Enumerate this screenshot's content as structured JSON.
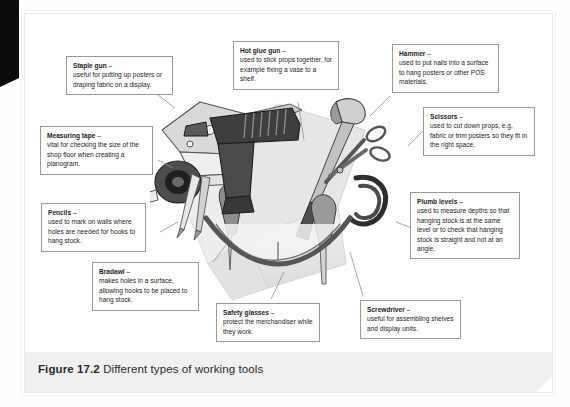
{
  "figure": {
    "number": "Figure 17.2",
    "caption": "Different types of working tools",
    "alt": "Greyscale illustration of a pile of working tools in a cardboard box"
  },
  "colors": {
    "page_background": "#ffffff",
    "caption_band": "#f0f0f0",
    "callout_border": "#9a9a9a",
    "leader_line": "#8a8a8a",
    "text": "#1d1d1d",
    "edge_tab": "#0b0b0b"
  },
  "callouts": [
    {
      "id": "staple-gun",
      "title": "Staple gun",
      "dash": " –",
      "body": "useful for putting up posters or draping fabric on a display."
    },
    {
      "id": "measuring-tape",
      "title": "Measuring tape",
      "dash": " –",
      "body": "vital for checking the size of the shop floor when creating a planogram."
    },
    {
      "id": "pencils",
      "title": "Pencils",
      "dash": " –",
      "body": "used to mark on walls where holes are needed for hooks to hang stock."
    },
    {
      "id": "bradawl",
      "title": "Bradawl",
      "dash": " –",
      "body": "makes holes in a surface, allowing hooks to be placed to hang stock."
    },
    {
      "id": "safety-glasses",
      "title": "Safety glasses",
      "dash": " –",
      "body": "protect the merchandiser while they work."
    },
    {
      "id": "screwdriver",
      "title": "Screwdriver",
      "dash": " –",
      "body": "useful for assembling shelves and display units."
    },
    {
      "id": "plumb-levels",
      "title": "Plumb levels",
      "dash": " –",
      "body": "used to measure depths so that hanging stock is at the same level or to check that hanging stock is straight and not at an angle."
    },
    {
      "id": "scissors",
      "title": "Scissors",
      "dash": " –",
      "body": "used to cut down props, e.g. fabric or trim posters so they fit in the right space."
    },
    {
      "id": "hammer",
      "title": "Hammer",
      "dash": " –",
      "body": "used to put nails into a surface to hang posters or other POS materials."
    },
    {
      "id": "hot-glue-gun",
      "title": "Hot glue gun",
      "dash": " –",
      "body": "used to stick props together, for example fixing a vase to a shelf."
    }
  ]
}
